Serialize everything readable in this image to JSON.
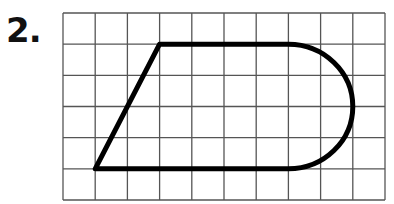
{
  "problem": {
    "number_label": "2."
  },
  "grid": {
    "cols": 10,
    "rows": 6,
    "x0": 63,
    "y0": 13,
    "x1": 385,
    "y1": 200,
    "line_color": "#555555"
  },
  "shape": {
    "description": "Trapezoid-like figure with a semicircular right end on a grid",
    "vertices_grid": [
      [
        1,
        5
      ],
      [
        3,
        1
      ],
      [
        7,
        1
      ],
      [
        7,
        5
      ]
    ],
    "arc": {
      "center_grid": [
        7,
        3
      ],
      "radius_cells": 2,
      "side": "right"
    },
    "stroke_color": "#000000"
  }
}
